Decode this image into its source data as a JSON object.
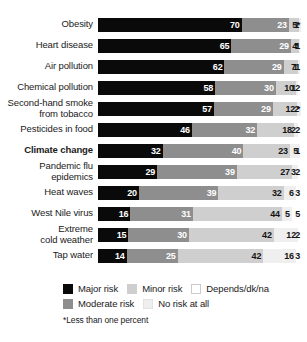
{
  "chart_data": {
    "type": "bar",
    "subtype": "stacked-horizontal-100",
    "title": "",
    "xlabel": "",
    "ylabel": "",
    "xlim": [
      0,
      100
    ],
    "grid": false,
    "legend_position": "bottom-left",
    "categories": [
      "Obesity",
      "Heart disease",
      "Air pollution",
      "Chemical pollution",
      "Second-hand smoke\nfrom tobacco",
      "Pesticides in food",
      "Climate change",
      "Pandemic flu\nepidemics",
      "Heat waves",
      "West Nile virus",
      "Extreme\ncold weather",
      "Tap water"
    ],
    "series": [
      {
        "name": "Major risk",
        "key": "major",
        "color": "#0a0a0a",
        "values": [
          70,
          65,
          62,
          58,
          57,
          46,
          32,
          29,
          20,
          16,
          15,
          14
        ]
      },
      {
        "name": "Moderate risk",
        "key": "moderate",
        "color": "#8e8e8e",
        "values": [
          23,
          29,
          29,
          30,
          29,
          32,
          40,
          39,
          39,
          31,
          30,
          25
        ]
      },
      {
        "name": "Minor risk",
        "key": "minor",
        "color": "#cfcfcf",
        "values": [
          5,
          4,
          7,
          10,
          12,
          18,
          23,
          27,
          32,
          44,
          42,
          42
        ]
      },
      {
        "name": "No risk at all",
        "key": "norisk",
        "color": "#efefef",
        "values": [
          1,
          0.4,
          1,
          1,
          2,
          2,
          5,
          3,
          6,
          5,
          12,
          16
        ]
      },
      {
        "name": "Depends/dk/na",
        "key": "depends",
        "color": "#ffffff",
        "values": [
          0.4,
          1,
          1,
          2,
          0.4,
          2,
          1,
          2,
          3,
          5,
          2,
          3
        ]
      }
    ],
    "rows": [
      {
        "label": "Obesity",
        "bold": false,
        "segments": [
          {
            "key": "major",
            "value": 70,
            "display": "70"
          },
          {
            "key": "moderate",
            "value": 23,
            "display": "23"
          },
          {
            "key": "minor",
            "value": 5,
            "display": "5"
          },
          {
            "key": "norisk",
            "value": 1,
            "display": "1"
          },
          {
            "key": "depends",
            "value": 0.4,
            "display": "*"
          }
        ]
      },
      {
        "label": "Heart disease",
        "bold": false,
        "segments": [
          {
            "key": "major",
            "value": 65,
            "display": "65"
          },
          {
            "key": "moderate",
            "value": 29,
            "display": "29"
          },
          {
            "key": "minor",
            "value": 4,
            "display": "4"
          },
          {
            "key": "norisk",
            "value": 0.4,
            "display": "*"
          },
          {
            "key": "depends",
            "value": 1,
            "display": "1"
          }
        ]
      },
      {
        "label": "Air pollution",
        "bold": false,
        "segments": [
          {
            "key": "major",
            "value": 62,
            "display": "62"
          },
          {
            "key": "moderate",
            "value": 29,
            "display": "29"
          },
          {
            "key": "minor",
            "value": 7,
            "display": "7"
          },
          {
            "key": "norisk",
            "value": 1,
            "display": "1"
          },
          {
            "key": "depends",
            "value": 1,
            "display": "1"
          }
        ]
      },
      {
        "label": "Chemical pollution",
        "bold": false,
        "segments": [
          {
            "key": "major",
            "value": 58,
            "display": "58"
          },
          {
            "key": "moderate",
            "value": 30,
            "display": "30"
          },
          {
            "key": "minor",
            "value": 10,
            "display": "10"
          },
          {
            "key": "norisk",
            "value": 1,
            "display": "1"
          },
          {
            "key": "depends",
            "value": 2,
            "display": "2"
          }
        ]
      },
      {
        "label": "Second-hand smoke\nfrom tobacco",
        "bold": false,
        "segments": [
          {
            "key": "major",
            "value": 57,
            "display": "57"
          },
          {
            "key": "moderate",
            "value": 29,
            "display": "29"
          },
          {
            "key": "minor",
            "value": 12,
            "display": "12"
          },
          {
            "key": "norisk",
            "value": 2,
            "display": "2"
          },
          {
            "key": "depends",
            "value": 0.4,
            "display": "*"
          }
        ]
      },
      {
        "label": "Pesticides in food",
        "bold": false,
        "segments": [
          {
            "key": "major",
            "value": 46,
            "display": "46"
          },
          {
            "key": "moderate",
            "value": 32,
            "display": "32"
          },
          {
            "key": "minor",
            "value": 18,
            "display": "18"
          },
          {
            "key": "norisk",
            "value": 2,
            "display": "2"
          },
          {
            "key": "depends",
            "value": 2,
            "display": "2"
          }
        ]
      },
      {
        "label": "Climate change",
        "bold": true,
        "segments": [
          {
            "key": "major",
            "value": 32,
            "display": "32"
          },
          {
            "key": "moderate",
            "value": 40,
            "display": "40"
          },
          {
            "key": "minor",
            "value": 23,
            "display": "23"
          },
          {
            "key": "norisk",
            "value": 5,
            "display": "5"
          },
          {
            "key": "depends",
            "value": 1,
            "display": "1"
          }
        ]
      },
      {
        "label": "Pandemic flu\nepidemics",
        "bold": false,
        "segments": [
          {
            "key": "major",
            "value": 29,
            "display": "29"
          },
          {
            "key": "moderate",
            "value": 39,
            "display": "39"
          },
          {
            "key": "minor",
            "value": 27,
            "display": "27"
          },
          {
            "key": "norisk",
            "value": 3,
            "display": "3"
          },
          {
            "key": "depends",
            "value": 2,
            "display": "2"
          }
        ]
      },
      {
        "label": "Heat waves",
        "bold": false,
        "segments": [
          {
            "key": "major",
            "value": 20,
            "display": "20"
          },
          {
            "key": "moderate",
            "value": 39,
            "display": "39"
          },
          {
            "key": "minor",
            "value": 32,
            "display": "32"
          },
          {
            "key": "norisk",
            "value": 6,
            "display": "6"
          },
          {
            "key": "depends",
            "value": 3,
            "display": "3"
          }
        ]
      },
      {
        "label": "West Nile virus",
        "bold": false,
        "segments": [
          {
            "key": "major",
            "value": 16,
            "display": "16"
          },
          {
            "key": "moderate",
            "value": 31,
            "display": "31"
          },
          {
            "key": "minor",
            "value": 44,
            "display": "44"
          },
          {
            "key": "norisk",
            "value": 5,
            "display": "5"
          },
          {
            "key": "depends",
            "value": 5,
            "display": "5"
          }
        ]
      },
      {
        "label": "Extreme\ncold weather",
        "bold": false,
        "segments": [
          {
            "key": "major",
            "value": 15,
            "display": "15"
          },
          {
            "key": "moderate",
            "value": 30,
            "display": "30"
          },
          {
            "key": "minor",
            "value": 42,
            "display": "42"
          },
          {
            "key": "norisk",
            "value": 12,
            "display": "12"
          },
          {
            "key": "depends",
            "value": 2,
            "display": "2"
          }
        ]
      },
      {
        "label": "Tap water",
        "bold": false,
        "segments": [
          {
            "key": "major",
            "value": 14,
            "display": "14"
          },
          {
            "key": "moderate",
            "value": 25,
            "display": "25"
          },
          {
            "key": "minor",
            "value": 42,
            "display": "42"
          },
          {
            "key": "norisk",
            "value": 16,
            "display": "16"
          },
          {
            "key": "depends",
            "value": 3,
            "display": "3"
          }
        ]
      }
    ],
    "legend": [
      [
        {
          "key": "major",
          "label": "Major risk"
        },
        {
          "key": "minor",
          "label": "Minor risk"
        },
        {
          "key": "depends",
          "label": "Depends/dk/na"
        }
      ],
      [
        {
          "key": "moderate",
          "label": "Moderate risk"
        },
        {
          "key": "norisk",
          "label": "No risk at all"
        }
      ]
    ],
    "footnote": "*Less than one percent"
  }
}
